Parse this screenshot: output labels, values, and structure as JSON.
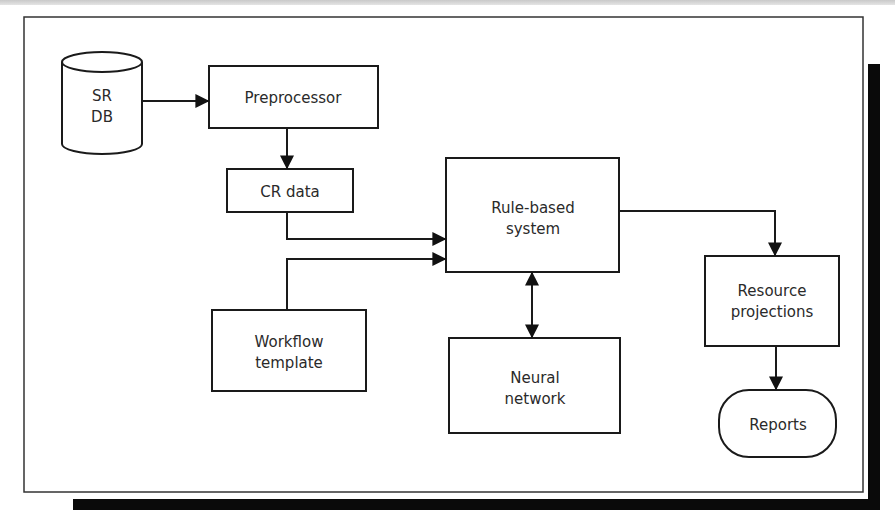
{
  "diagram": {
    "nodes": {
      "sr_db": {
        "lines": [
          "SR",
          "DB"
        ],
        "shape": "cylinder"
      },
      "preprocessor": {
        "lines": [
          "Preprocessor"
        ],
        "shape": "rectangle"
      },
      "cr_data": {
        "lines": [
          "CR data"
        ],
        "shape": "rectangle"
      },
      "rule_based": {
        "lines": [
          "Rule-based",
          "system"
        ],
        "shape": "rectangle"
      },
      "workflow": {
        "lines": [
          "Workflow",
          "template"
        ],
        "shape": "rectangle"
      },
      "neural": {
        "lines": [
          "Neural",
          "network"
        ],
        "shape": "rectangle"
      },
      "resource": {
        "lines": [
          "Resource",
          "projections"
        ],
        "shape": "rectangle"
      },
      "reports": {
        "lines": [
          "Reports"
        ],
        "shape": "rounded-terminal"
      }
    },
    "edges": [
      {
        "from": "SR DB",
        "to": "Preprocessor",
        "direction": "forward"
      },
      {
        "from": "Preprocessor",
        "to": "CR data",
        "direction": "forward"
      },
      {
        "from": "CR data",
        "to": "Rule-based system",
        "direction": "forward"
      },
      {
        "from": "Workflow template",
        "to": "Rule-based system",
        "direction": "forward"
      },
      {
        "from": "Rule-based system",
        "to": "Neural network",
        "direction": "bidirectional"
      },
      {
        "from": "Rule-based system",
        "to": "Resource projections",
        "direction": "forward"
      },
      {
        "from": "Resource projections",
        "to": "Reports",
        "direction": "forward"
      }
    ]
  }
}
